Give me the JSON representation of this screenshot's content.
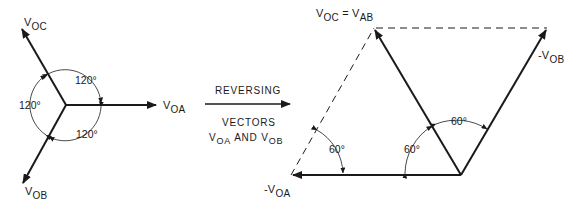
{
  "left_diagram": {
    "vectors": [
      {
        "id": "voc",
        "label_main": "V",
        "label_sub": "OC"
      },
      {
        "id": "voa",
        "label_main": "V",
        "label_sub": "OA"
      },
      {
        "id": "vob",
        "label_main": "V",
        "label_sub": "OB"
      }
    ],
    "angles": [
      "120°",
      "120°",
      "120°"
    ]
  },
  "transition": {
    "line1": "REVERSING",
    "line2": "VECTORS",
    "line3_v1_main": "V",
    "line3_v1_sub": "OA",
    "line3_and": "AND",
    "line3_v2_main": "V",
    "line3_v2_sub": "OB"
  },
  "right_diagram": {
    "top_label_v1_main": "V",
    "top_label_v1_sub": "OC",
    "top_label_eq": "=",
    "top_label_v2_main": "V",
    "top_label_v2_sub": "AB",
    "neg_vob_prefix": "-V",
    "neg_vob_sub": "OB",
    "neg_voa_prefix": "-V",
    "neg_voa_sub": "OA",
    "angles": [
      "60°",
      "60°",
      "60°"
    ]
  },
  "colors": {
    "line": "#1a1a1a",
    "background": "#ffffff"
  }
}
